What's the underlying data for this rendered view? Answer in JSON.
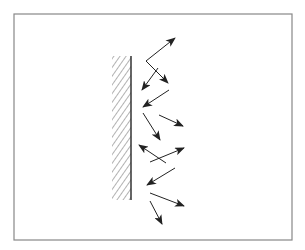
{
  "figure": {
    "frame": {
      "x": 14,
      "y": 14,
      "width": 278,
      "height": 226,
      "stroke": "#888888"
    },
    "wall": {
      "x": 112,
      "y": 56,
      "width": 19,
      "height": 144,
      "edge_x": 131,
      "stroke": "#333333",
      "hatch_color": "#555555"
    },
    "arrow_color": "#222222",
    "arrows": [
      {
        "x1": 146,
        "y1": 61,
        "x2": 175,
        "y2": 38
      },
      {
        "x1": 146,
        "y1": 61,
        "x2": 168,
        "y2": 83
      },
      {
        "x1": 158,
        "y1": 68,
        "x2": 142,
        "y2": 90
      },
      {
        "x1": 169,
        "y1": 90,
        "x2": 143,
        "y2": 107
      },
      {
        "x1": 143,
        "y1": 113,
        "x2": 160,
        "y2": 140
      },
      {
        "x1": 159,
        "y1": 115,
        "x2": 183,
        "y2": 126
      },
      {
        "x1": 166,
        "y1": 163,
        "x2": 139,
        "y2": 145
      },
      {
        "x1": 150,
        "y1": 162,
        "x2": 184,
        "y2": 148
      },
      {
        "x1": 175,
        "y1": 168,
        "x2": 147,
        "y2": 185
      },
      {
        "x1": 150,
        "y1": 193,
        "x2": 184,
        "y2": 206
      },
      {
        "x1": 150,
        "y1": 201,
        "x2": 162,
        "y2": 224
      }
    ]
  }
}
